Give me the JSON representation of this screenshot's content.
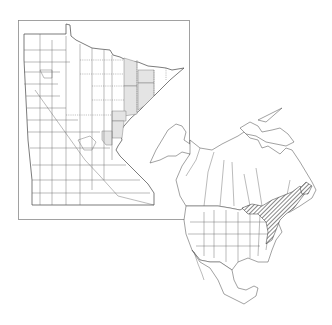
{
  "figure": {
    "type": "species-distribution-map",
    "background": "#ffffff",
    "panels": [
      {
        "name": "minnesota-county-map",
        "region": "Minnesota",
        "frame": {
          "x": 18,
          "y": 20,
          "width": 172,
          "height": 200
        },
        "shading_color": "#e4e4e4",
        "shaded_area": "northeastern counties along Lake Superior shore (Arrowhead region) and east-central counties",
        "shaded_county_count": 7
      },
      {
        "name": "north-america-range-map",
        "region": "North America",
        "hatch_color": "#333333",
        "hatched_area": "northeastern United States and southeastern Canada (Great Lakes to Atlantic, Newfoundland)"
      }
    ],
    "labels": []
  }
}
